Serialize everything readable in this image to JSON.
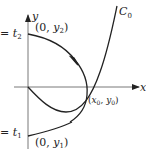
{
  "diagram": {
    "axis_x_label": "x",
    "axis_y_label": "y",
    "curve_label": "C",
    "curve_label_sub": "0",
    "point_top": {
      "open": "(0, ",
      "var": "y",
      "sub": "2",
      "close": ")"
    },
    "point_bottom": {
      "open": "(0, ",
      "var": "y",
      "sub": "1",
      "close": ")"
    },
    "point_intersect": {
      "open": "(",
      "var1": "x",
      "sub1": "0",
      "sep": ", ",
      "var2": "y",
      "sub2": "0",
      "close": ")"
    },
    "param_top": {
      "eq": "= ",
      "var": "t",
      "sub": "2"
    },
    "param_bottom": {
      "eq": "= ",
      "var": "t",
      "sub": "1"
    },
    "colors": {
      "ink": "#222222",
      "axis": "#444444"
    }
  }
}
